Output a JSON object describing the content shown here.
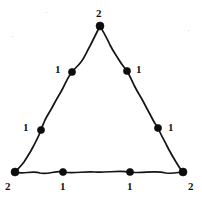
{
  "figure": {
    "background_color": "#ffffff",
    "stroke_color": "#141414",
    "node_color": "#0d0d0d",
    "label_color": "#101010",
    "width": 202,
    "height": 200
  },
  "chart_data": {
    "type": "diagram",
    "shape": "triangle",
    "title": "",
    "nodes": [
      {
        "id": "apex",
        "label": "2",
        "x": 100,
        "y": 26,
        "role": "vertex",
        "label_position": "above",
        "label_x": 96,
        "label_y": 8
      },
      {
        "id": "upper-left",
        "label": "1",
        "x": 72,
        "y": 72,
        "role": "edge-node",
        "label_position": "left",
        "label_x": 55,
        "label_y": 64
      },
      {
        "id": "upper-right",
        "label": "1",
        "x": 127,
        "y": 71,
        "role": "edge-node",
        "label_position": "right",
        "label_x": 136,
        "label_y": 64
      },
      {
        "id": "lower-left",
        "label": "1",
        "x": 41,
        "y": 130,
        "role": "edge-node",
        "label_position": "left",
        "label_x": 23,
        "label_y": 122
      },
      {
        "id": "lower-right",
        "label": "1",
        "x": 158,
        "y": 128,
        "role": "edge-node",
        "label_position": "right",
        "label_x": 168,
        "label_y": 122
      },
      {
        "id": "bottom-left",
        "label": "2",
        "x": 15,
        "y": 172,
        "role": "vertex",
        "label_position": "below-left",
        "label_x": 5,
        "label_y": 181
      },
      {
        "id": "bottom-mid-l",
        "label": "1",
        "x": 63,
        "y": 172,
        "role": "edge-node",
        "label_position": "below",
        "label_x": 60,
        "label_y": 181
      },
      {
        "id": "bottom-mid-r",
        "label": "1",
        "x": 130,
        "y": 172,
        "role": "edge-node",
        "label_position": "below",
        "label_x": 127,
        "label_y": 181
      },
      {
        "id": "bottom-right",
        "label": "2",
        "x": 183,
        "y": 172,
        "role": "vertex",
        "label_position": "below-right",
        "label_x": 188,
        "label_y": 181
      }
    ],
    "edges": [
      {
        "id": "edge-left",
        "from": "apex",
        "to": "bottom-left",
        "via": [
          "upper-left",
          "lower-left"
        ],
        "path": "M 100 26 C 96 34 94 38 90 46 C 86 53 85 57 81 62 C 78 66 75 68 72 72 C 68 77 66 82 63 88 C 60 94 57 98 54 104 C 51 110 48 114 45 120 C 43 125 42 127 41 130 C 39 136 36 141 33 147 C 30 153 27 157 24 162 C 21 166 18 169 15 172"
      },
      {
        "id": "edge-right",
        "from": "apex",
        "to": "bottom-right",
        "via": [
          "upper-right",
          "lower-right"
        ],
        "path": "M 100 26 C 104 33 107 38 110 45 C 113 51 116 55 119 60 C 122 65 125 68 127 71 C 130 76 132 81 135 87 C 138 93 141 97 144 103 C 147 109 150 114 153 120 C 155 124 157 126 158 128 C 161 135 164 140 167 146 C 170 152 173 157 176 162 C 179 167 181 170 183 172"
      },
      {
        "id": "edge-bottom",
        "from": "bottom-left",
        "to": "bottom-right",
        "via": [
          "bottom-mid-l",
          "bottom-mid-r"
        ],
        "path": "M 15 172 C 23 175 32 170 40 173 C 48 175 56 170 63 172 C 74 174 84 171 95 172 C 106 173 118 170 130 172 C 142 174 154 170 166 173 C 174 174 179 172 183 172"
      }
    ],
    "legend": {
      "2": "corner vertex weight",
      "1": "edge node weight"
    }
  }
}
